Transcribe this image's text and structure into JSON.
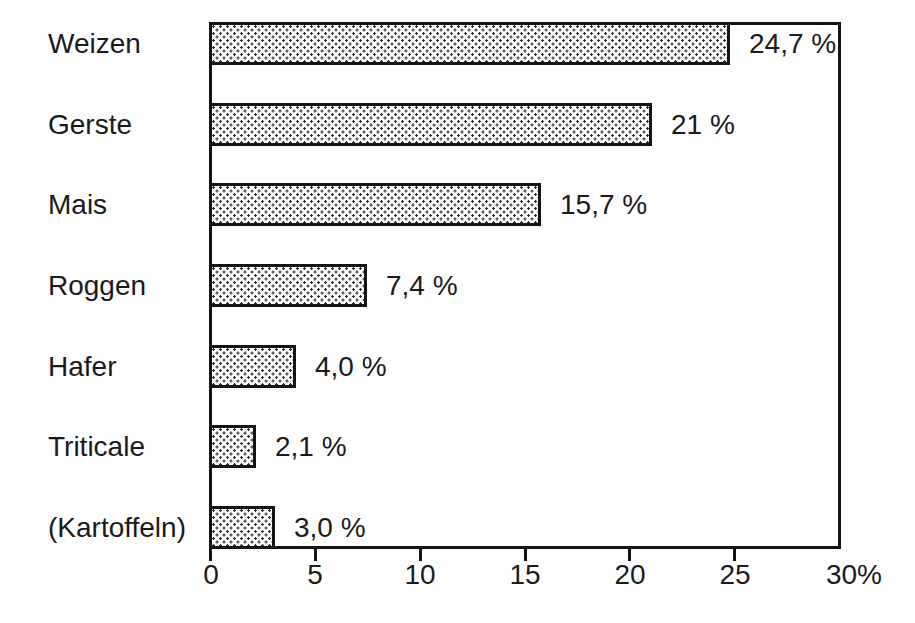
{
  "chart_data": {
    "type": "bar",
    "orientation": "horizontal",
    "title": "",
    "xlabel": "",
    "ylabel": "",
    "categories": [
      "Weizen",
      "Gerste",
      "Mais",
      "Roggen",
      "Hafer",
      "Triticale",
      "(Kartoffeln)"
    ],
    "values": [
      24.7,
      21,
      15.7,
      7.4,
      4.0,
      2.1,
      3.0
    ],
    "value_labels": [
      "24,7 %",
      "21 %",
      "15,7 %",
      "7,4 %",
      "4,0 %",
      "2,1 %",
      "3,0 %"
    ],
    "xlim": [
      0,
      30
    ],
    "x_ticks": [
      0,
      5,
      10,
      15,
      20,
      25,
      30
    ],
    "x_tick_labels": [
      "0",
      "5",
      "10",
      "15",
      "20",
      "25",
      "30%"
    ],
    "grid": false,
    "legend": null,
    "bar_fill": "stipple-dot-pattern",
    "colors": {
      "border": "#141414",
      "text": "#1a1a1a",
      "dot": "#2d2d2d",
      "background": "#ffffff"
    }
  }
}
